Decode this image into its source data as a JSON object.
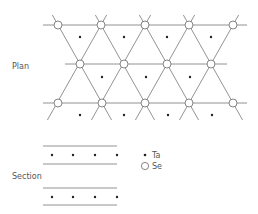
{
  "plan": {
    "label": "Plan",
    "label_pos": [
      12,
      69
    ],
    "horizontal_lines": [
      {
        "y": 25,
        "x1": 43,
        "x2": 247
      },
      {
        "y": 64,
        "x1": 65,
        "x2": 227
      },
      {
        "y": 103,
        "x1": 43,
        "x2": 247
      }
    ],
    "diag_y_range": [
      15,
      120
    ],
    "diag_down_right_top_x": [
      58,
      101,
      145,
      189
    ],
    "diag_down_left_top_x": [
      101,
      145,
      189,
      233
    ],
    "diag_top_y": 25,
    "diag_slope": 0.564,
    "se_atoms": [
      [
        58,
        25
      ],
      [
        101,
        25
      ],
      [
        145,
        25
      ],
      [
        189,
        25
      ],
      [
        233,
        25
      ],
      [
        80,
        64
      ],
      [
        124,
        64
      ],
      [
        167,
        64
      ],
      [
        211,
        64
      ],
      [
        58,
        103
      ],
      [
        102,
        103
      ],
      [
        145,
        103
      ],
      [
        189,
        103
      ],
      [
        233,
        103
      ]
    ],
    "ta_atoms": [
      [
        80,
        37
      ],
      [
        124,
        37
      ],
      [
        167,
        37
      ],
      [
        211,
        37
      ],
      [
        102,
        77
      ],
      [
        146,
        77
      ],
      [
        190,
        77
      ],
      [
        80,
        115
      ],
      [
        124,
        115
      ],
      [
        168,
        115
      ],
      [
        212,
        115
      ]
    ]
  },
  "section": {
    "label": "Section",
    "label_pos": [
      12,
      179
    ],
    "lines": [
      {
        "y": 146,
        "x1": 43,
        "x2": 117
      },
      {
        "y": 164,
        "x1": 43,
        "x2": 117
      },
      {
        "y": 188,
        "x1": 43,
        "x2": 117
      },
      {
        "y": 205,
        "x1": 43,
        "x2": 117
      }
    ],
    "ta_atoms": [
      [
        52,
        155
      ],
      [
        73,
        155
      ],
      [
        95,
        155
      ],
      [
        117,
        155
      ],
      [
        52,
        197
      ],
      [
        73,
        197
      ],
      [
        95,
        197
      ],
      [
        117,
        197
      ]
    ]
  },
  "legend": {
    "items": [
      {
        "symbol": "dot",
        "label": "Ta",
        "pos": [
          145,
          155
        ]
      },
      {
        "symbol": "circle",
        "label": "Se",
        "pos": [
          145,
          166
        ]
      }
    ]
  },
  "colors": {
    "line": "#777777",
    "atom_fill": "#ffffff",
    "dot": "#222222",
    "text": "#555555"
  }
}
